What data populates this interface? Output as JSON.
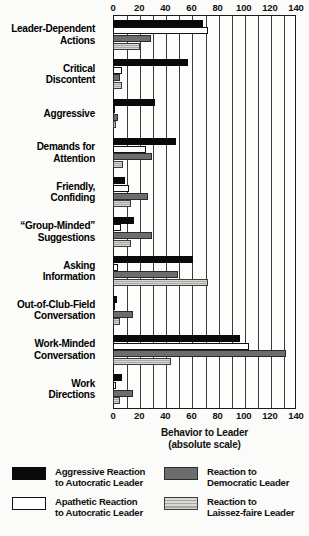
{
  "chart_data": {
    "type": "bar",
    "orientation": "horizontal",
    "title": "",
    "xlabel": "Behavior to Leader\n(absolute scale)",
    "xlabel_line1": "Behavior to Leader",
    "xlabel_line2": "(absolute scale)",
    "ylabel": "",
    "xlim": [
      0,
      140
    ],
    "xticks": [
      0,
      20,
      40,
      60,
      80,
      100,
      120,
      140
    ],
    "xtick_labels": [
      "0",
      "20",
      "40",
      "60",
      "80",
      "100",
      "120",
      "140"
    ],
    "minor_gridline_step": 10,
    "grid": true,
    "legend_position": "below-axis",
    "categories": [
      "Leader-Dependent\nActions",
      "Critical\nDiscontent",
      "Aggressive",
      "Demands for\nAttention",
      "Friendly,\nConfiding",
      "“Group-Minded”\nSuggestions",
      "Asking\nInformation",
      "Out-of-Club-Field\nConversation",
      "Work-Minded\nConversation",
      "Work\nDirections"
    ],
    "series": [
      {
        "name": "Aggressive Reaction to Autocratic Leader",
        "color": "#0a0a0a",
        "values": [
          69,
          57,
          32,
          48,
          9,
          16,
          61,
          3,
          97,
          7
        ]
      },
      {
        "name": "Apathetic Reaction to Autocratic Leader",
        "color": "#ffffff",
        "values": [
          73,
          7,
          1,
          25,
          12,
          6,
          4,
          1,
          104,
          2
        ]
      },
      {
        "name": "Reaction to Democratic Leader",
        "color": "#6d6d6d",
        "values": [
          29,
          5,
          4,
          30,
          27,
          30,
          50,
          15,
          132,
          15
        ]
      },
      {
        "name": "Reaction to Laissez-faire Leader",
        "color": "#b4b4b0",
        "values": [
          21,
          7,
          2,
          8,
          14,
          14,
          73,
          5,
          44,
          5
        ]
      }
    ]
  },
  "legend": {
    "entries": [
      {
        "label": "Aggressive Reaction\nto Autocratic Leader",
        "swatch": "solid-black"
      },
      {
        "label": "Reaction to\nDemocratic Leader",
        "swatch": "solid-gray"
      },
      {
        "label": "Apathetic Reaction\nto Autocratic Leader",
        "swatch": "outline-white"
      },
      {
        "label": "Reaction to\nLaissez-faire Leader",
        "swatch": "hatched-light-gray"
      }
    ]
  }
}
